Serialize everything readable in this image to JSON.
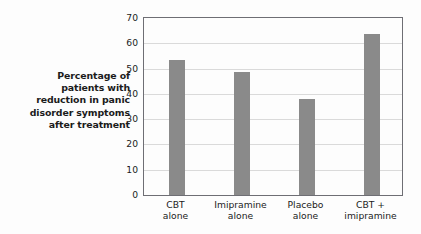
{
  "chart_data": {
    "type": "bar",
    "title": "",
    "subtitle": "",
    "xlabel": "",
    "ylabel": "Percentage of patients with reduction in panic disorder symptoms after treatment",
    "ylabel_lines": [
      "Percentage of",
      "patients with",
      "reduction in panic",
      "disorder symptoms",
      "after treatment"
    ],
    "categories": [
      "CBT alone",
      "Imipramine alone",
      "Placebo alone",
      "CBT + imipramine"
    ],
    "category_lines": [
      [
        "CBT",
        "alone"
      ],
      [
        "Imipramine",
        "alone"
      ],
      [
        "Placebo",
        "alone"
      ],
      [
        "CBT +",
        "imipramine"
      ]
    ],
    "values": [
      53.5,
      48.5,
      38,
      63.5
    ],
    "ylim": [
      0,
      70
    ],
    "yticks": [
      0,
      10,
      20,
      30,
      40,
      50,
      60,
      70
    ],
    "ytick_labels": [
      "0",
      "10",
      "20",
      "30",
      "40",
      "50",
      "60",
      "70"
    ],
    "grid": true,
    "grid_axis": "y",
    "legend": false,
    "legend_position": "none",
    "bar_color": "#8a8a8a",
    "grid_color": "#dadada",
    "axis_color": "#6e6e74",
    "background_color": "#fdfdfd",
    "text_color": "#1b1b1b"
  }
}
